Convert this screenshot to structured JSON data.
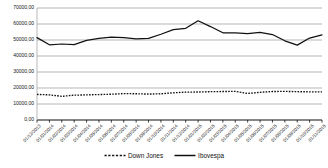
{
  "chart_data": {
    "type": "line",
    "title": "",
    "xlabel": "",
    "ylabel": "",
    "ylim": [
      0,
      70000
    ],
    "grid": true,
    "legend_position": "bottom-center",
    "y_ticks": [
      "0,00",
      "10000,00",
      "20000,00",
      "30000,00",
      "40000,00",
      "50000,00",
      "60000,00",
      "70000,00"
    ],
    "y_tick_values": [
      0,
      10000,
      20000,
      30000,
      40000,
      50000,
      60000,
      70000
    ],
    "categories": [
      "01/12/2013",
      "01/01/2014",
      "01/02/2014",
      "01/03/2014",
      "01/04/2014",
      "01/05/2014",
      "01/06/2014",
      "01/07/2014",
      "01/08/2014",
      "01/09/2014",
      "01/10/2014",
      "01/11/2014",
      "01/12/2014",
      "01/01/2015",
      "01/02/2015",
      "01/03/2015",
      "01/04/2015",
      "01/05/2015",
      "01/06/2015",
      "01/07/2015",
      "01/08/2015",
      "01/09/2015",
      "01/10/2015",
      "01/11/2015"
    ],
    "series": [
      {
        "name": "Down Jones",
        "style": "dashed",
        "color": "#111111",
        "values": [
          16000,
          15700,
          14800,
          15500,
          15700,
          15900,
          16100,
          16500,
          16400,
          16200,
          16400,
          17000,
          17400,
          17500,
          17700,
          17800,
          17900,
          16600,
          17300,
          17800,
          17900,
          17700,
          17600,
          17600
        ]
      },
      {
        "name": "Ibovespa",
        "style": "solid",
        "color": "#111111",
        "values": [
          51500,
          47000,
          47500,
          47100,
          49800,
          51000,
          51800,
          51500,
          50700,
          51000,
          53600,
          56500,
          57300,
          62000,
          58400,
          54500,
          54500,
          54000,
          54800,
          53400,
          49500,
          46800,
          51200,
          53200
        ]
      }
    ],
    "series_2_values_note": ""
  },
  "legend": {
    "entries": [
      {
        "label": "Down Jones"
      },
      {
        "label": "Ibovespa"
      }
    ]
  }
}
